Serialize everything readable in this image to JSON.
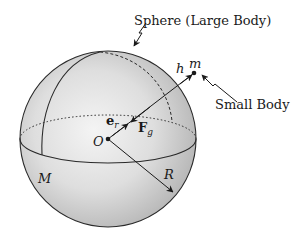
{
  "diagram": {
    "title_labels": {
      "sphere": "Sphere (Large Body)",
      "small_body": "Small Body"
    },
    "symbols": {
      "origin": "O",
      "mass_large": "M",
      "mass_small": "m",
      "radius": "R",
      "height": "h",
      "unit_vector_base": "e",
      "unit_vector_sub": "r",
      "force_base": "F",
      "force_sub": "g"
    },
    "colors": {
      "sphere_fill_light": "#f2f2f2",
      "sphere_fill_dark": "#b9b9b9",
      "stroke": "#2a2a2a",
      "background": "#ffffff"
    }
  }
}
